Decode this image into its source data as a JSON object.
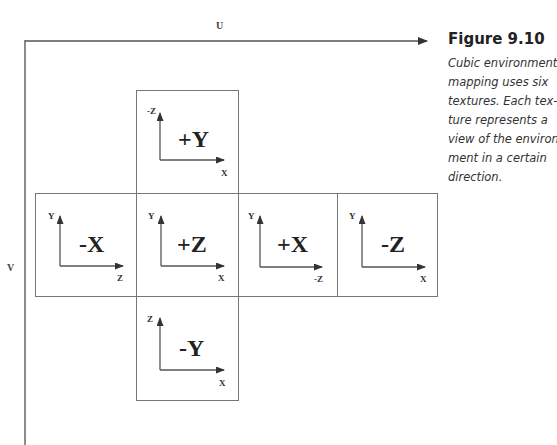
{
  "figure": {
    "title": "Figure 9.10",
    "caption_lines": [
      "Cubic environment",
      "mapping uses six",
      "textures. Each tex-",
      "ture represents a",
      "view of the environ-",
      "ment in a certain",
      "direction."
    ]
  },
  "axes": {
    "u_label": "U",
    "v_label": "V"
  },
  "faces": [
    {
      "id": "pos-y",
      "label": "+Y",
      "vertical_axis": "-Z",
      "horizontal_axis": "X"
    },
    {
      "id": "neg-x",
      "label": "-X",
      "vertical_axis": "Y",
      "horizontal_axis": "Z"
    },
    {
      "id": "pos-z",
      "label": "+Z",
      "vertical_axis": "Y",
      "horizontal_axis": "X"
    },
    {
      "id": "pos-x",
      "label": "+X",
      "vertical_axis": "Y",
      "horizontal_axis": "-Z"
    },
    {
      "id": "neg-z",
      "label": "-Z",
      "vertical_axis": "Y",
      "horizontal_axis": "X"
    },
    {
      "id": "neg-y",
      "label": "-Y",
      "vertical_axis": "Z",
      "horizontal_axis": "X"
    }
  ],
  "colors": {
    "line": "#555555",
    "border": "#777777",
    "text": "#222222"
  }
}
